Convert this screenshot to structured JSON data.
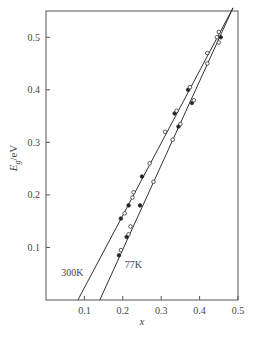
{
  "chart_data": {
    "type": "scatter",
    "title": "",
    "xlabel": "x",
    "ylabel": "E_g/eV",
    "ylabel_main": "E",
    "ylabel_sub": "g",
    "ylabel_unit": "/eV",
    "xlim": [
      0,
      0.5
    ],
    "ylim": [
      0,
      0.55
    ],
    "grid": false,
    "legend": "none",
    "x_ticks": [
      0.1,
      0.2,
      0.3,
      0.4,
      0.5
    ],
    "x_tick_labels": [
      "0.1",
      "0.2",
      "0.3",
      "0.4",
      "0.5"
    ],
    "y_ticks": [
      0.1,
      0.2,
      0.3,
      0.4,
      0.5
    ],
    "y_tick_labels": [
      "0.1",
      "0.2",
      "0.3",
      "0.4",
      "0.5"
    ],
    "annotations": [
      {
        "text": "300K",
        "x": 0.04,
        "y": 0.045
      },
      {
        "text": "77K",
        "x": 0.205,
        "y": 0.06
      }
    ],
    "series": [
      {
        "name": "300K",
        "fit_line": {
          "x": [
            0.083,
            0.487
          ],
          "y": [
            0.0,
            0.556
          ]
        },
        "points": [
          {
            "x": 0.195,
            "y": 0.155,
            "filled": true
          },
          {
            "x": 0.205,
            "y": 0.165,
            "filled": false
          },
          {
            "x": 0.215,
            "y": 0.18,
            "filled": true
          },
          {
            "x": 0.225,
            "y": 0.195,
            "filled": false
          },
          {
            "x": 0.228,
            "y": 0.205,
            "filled": false
          },
          {
            "x": 0.25,
            "y": 0.235,
            "filled": true
          },
          {
            "x": 0.27,
            "y": 0.26,
            "filled": false
          },
          {
            "x": 0.31,
            "y": 0.32,
            "filled": false
          },
          {
            "x": 0.335,
            "y": 0.355,
            "filled": true
          },
          {
            "x": 0.34,
            "y": 0.36,
            "filled": false
          },
          {
            "x": 0.37,
            "y": 0.4,
            "filled": true
          },
          {
            "x": 0.375,
            "y": 0.405,
            "filled": false
          },
          {
            "x": 0.42,
            "y": 0.47,
            "filled": false
          },
          {
            "x": 0.445,
            "y": 0.5,
            "filled": false
          },
          {
            "x": 0.45,
            "y": 0.51,
            "filled": false
          }
        ]
      },
      {
        "name": "77K",
        "fit_line": {
          "x": [
            0.14,
            0.487
          ],
          "y": [
            0.0,
            0.556
          ]
        },
        "points": [
          {
            "x": 0.19,
            "y": 0.085,
            "filled": true
          },
          {
            "x": 0.195,
            "y": 0.095,
            "filled": false
          },
          {
            "x": 0.21,
            "y": 0.12,
            "filled": true
          },
          {
            "x": 0.215,
            "y": 0.125,
            "filled": false
          },
          {
            "x": 0.22,
            "y": 0.14,
            "filled": false
          },
          {
            "x": 0.245,
            "y": 0.18,
            "filled": true
          },
          {
            "x": 0.28,
            "y": 0.225,
            "filled": false
          },
          {
            "x": 0.33,
            "y": 0.305,
            "filled": false
          },
          {
            "x": 0.345,
            "y": 0.33,
            "filled": true
          },
          {
            "x": 0.35,
            "y": 0.335,
            "filled": false
          },
          {
            "x": 0.38,
            "y": 0.375,
            "filled": true
          },
          {
            "x": 0.385,
            "y": 0.38,
            "filled": false
          },
          {
            "x": 0.42,
            "y": 0.45,
            "filled": false
          },
          {
            "x": 0.45,
            "y": 0.49,
            "filled": false
          },
          {
            "x": 0.455,
            "y": 0.5,
            "filled": true
          }
        ]
      }
    ]
  }
}
